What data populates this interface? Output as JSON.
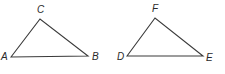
{
  "diagram": {
    "type": "geometry-figure",
    "stroke_color": "#3a3a3a",
    "label_color": "#2a2a2a",
    "triangles": [
      {
        "name": "triangle ABC",
        "points": "11,57 40,19 88,56",
        "vertices": [
          {
            "label": "A",
            "x": 11,
            "y": 57,
            "label_x": 1,
            "label_y": 60
          },
          {
            "label": "C",
            "x": 40,
            "y": 19,
            "label_x": 37,
            "label_y": 13
          },
          {
            "label": "B",
            "x": 88,
            "y": 56,
            "label_x": 92,
            "label_y": 60
          }
        ]
      },
      {
        "name": "triangle DEF",
        "points": "127,56 155,18 203,56",
        "vertices": [
          {
            "label": "D",
            "x": 127,
            "y": 56,
            "label_x": 117,
            "label_y": 60
          },
          {
            "label": "F",
            "x": 155,
            "y": 18,
            "label_x": 152,
            "label_y": 12
          },
          {
            "label": "E",
            "x": 203,
            "y": 56,
            "label_x": 206,
            "label_y": 61
          }
        ]
      }
    ]
  }
}
